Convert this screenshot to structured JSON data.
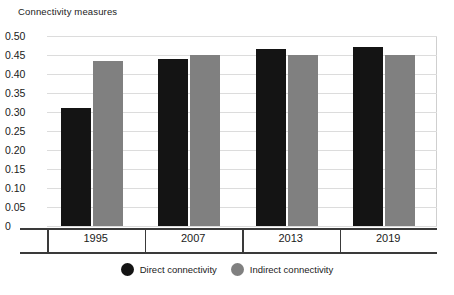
{
  "chart_data": {
    "type": "bar",
    "title": "Connectivity measures",
    "xlabel": "",
    "ylabel": "",
    "categories": [
      "1995",
      "2007",
      "2013",
      "2019"
    ],
    "series": [
      {
        "name": "Direct connectivity",
        "color": "#141414",
        "values": [
          0.31,
          0.44,
          0.465,
          0.47
        ]
      },
      {
        "name": "Indirect connectivity",
        "color": "#808080",
        "values": [
          0.435,
          0.45,
          0.45,
          0.45
        ]
      }
    ],
    "ylim": [
      0,
      0.5
    ],
    "ytick_step": 0.05,
    "ytick_labels": [
      "0.50",
      "0.45",
      "0.40",
      "0.35",
      "0.30",
      "0.25",
      "0.20",
      "0.15",
      "0.10",
      "0.05",
      "0"
    ],
    "ytick_values": [
      0.5,
      0.45,
      0.4,
      0.35,
      0.3,
      0.25,
      0.2,
      0.15,
      0.1,
      0.05,
      0
    ],
    "grid": true,
    "legend_position": "bottom-center"
  },
  "legend": {
    "items": [
      {
        "label": "Direct connectivity",
        "swatch": "circle-black"
      },
      {
        "label": "Indirect connectivity",
        "swatch": "circle-gray"
      }
    ]
  },
  "colors": {
    "direct": "#141414",
    "indirect": "#808080",
    "gridline": "#dcdcdc",
    "axis": "#3a3a3a",
    "background": "#ffffff"
  }
}
